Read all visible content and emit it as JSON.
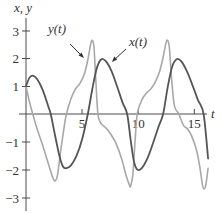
{
  "chart_data": {
    "type": "line",
    "title": "",
    "xlabel": "t",
    "ylabel": "x, y",
    "xlim": [
      0,
      16.3
    ],
    "ylim": [
      -3.4,
      3.6
    ],
    "grid": false,
    "legend": "inline annotations with arrows",
    "x_ticks": [
      5,
      10,
      15
    ],
    "x_tick_labels": [
      "5",
      "10",
      "15"
    ],
    "y_ticks": [
      3,
      2,
      1,
      -1,
      -2,
      -3
    ],
    "y_tick_labels": [
      "3",
      "2",
      "1",
      "−1",
      "−2",
      "−3"
    ],
    "series": [
      {
        "name": "x(t)",
        "label": "x(t)",
        "color": "#555555",
        "points": [
          [
            0,
            1.0
          ],
          [
            0.3,
            1.3
          ],
          [
            0.6,
            1.38
          ],
          [
            1.0,
            1.25
          ],
          [
            1.5,
            0.85
          ],
          [
            2.0,
            0.25
          ],
          [
            2.2,
            0.0
          ],
          [
            2.6,
            -0.8
          ],
          [
            3.0,
            -1.55
          ],
          [
            3.3,
            -1.9
          ],
          [
            3.6,
            -1.95
          ],
          [
            4.0,
            -1.85
          ],
          [
            4.5,
            -1.5
          ],
          [
            5.0,
            -0.9
          ],
          [
            5.5,
            0.0
          ],
          [
            5.9,
            0.9
          ],
          [
            6.3,
            1.65
          ],
          [
            6.7,
            1.97
          ],
          [
            7.1,
            1.9
          ],
          [
            7.6,
            1.55
          ],
          [
            8.1,
            1.0
          ],
          [
            8.6,
            0.4
          ],
          [
            9.0,
            0.0
          ],
          [
            9.3,
            -0.9
          ],
          [
            9.6,
            -1.7
          ],
          [
            9.9,
            -2.0
          ],
          [
            10.3,
            -1.95
          ],
          [
            10.8,
            -1.6
          ],
          [
            11.3,
            -1.05
          ],
          [
            11.8,
            -0.45
          ],
          [
            12.2,
            0.0
          ],
          [
            12.6,
            0.95
          ],
          [
            13.0,
            1.7
          ],
          [
            13.4,
            1.97
          ],
          [
            13.8,
            1.9
          ],
          [
            14.3,
            1.55
          ],
          [
            14.8,
            1.05
          ],
          [
            15.3,
            0.5
          ],
          [
            15.8,
            0.0
          ],
          [
            16.2,
            -1.6
          ]
        ]
      },
      {
        "name": "y(t)",
        "label": "y(t)",
        "color": "#a8a8a8",
        "points": [
          [
            0,
            1.0
          ],
          [
            0.3,
            0.45
          ],
          [
            0.6,
            0.0
          ],
          [
            1.0,
            -0.55
          ],
          [
            1.5,
            -1.15
          ],
          [
            2.0,
            -1.8
          ],
          [
            2.4,
            -2.3
          ],
          [
            2.6,
            -2.4
          ],
          [
            2.8,
            -2.2
          ],
          [
            3.1,
            -1.3
          ],
          [
            3.4,
            -0.45
          ],
          [
            3.6,
            0.0
          ],
          [
            4.0,
            0.55
          ],
          [
            4.4,
            0.9
          ],
          [
            4.8,
            1.1
          ],
          [
            5.2,
            1.45
          ],
          [
            5.5,
            1.95
          ],
          [
            5.75,
            2.5
          ],
          [
            5.9,
            2.65
          ],
          [
            6.05,
            2.4
          ],
          [
            6.2,
            1.3
          ],
          [
            6.4,
            0.0
          ],
          [
            6.7,
            -0.35
          ],
          [
            7.1,
            -0.5
          ],
          [
            7.5,
            -0.7
          ],
          [
            8.0,
            -1.05
          ],
          [
            8.5,
            -1.6
          ],
          [
            8.9,
            -2.2
          ],
          [
            9.2,
            -2.55
          ],
          [
            9.3,
            -2.6
          ],
          [
            9.5,
            -2.2
          ],
          [
            9.7,
            -1.0
          ],
          [
            9.9,
            0.0
          ],
          [
            10.3,
            0.5
          ],
          [
            10.7,
            0.75
          ],
          [
            11.1,
            0.9
          ],
          [
            11.5,
            1.15
          ],
          [
            11.9,
            1.55
          ],
          [
            12.2,
            2.05
          ],
          [
            12.45,
            2.55
          ],
          [
            12.6,
            2.65
          ],
          [
            12.75,
            2.4
          ],
          [
            12.95,
            1.3
          ],
          [
            13.2,
            0.3
          ],
          [
            13.6,
            0.0
          ],
          [
            14.0,
            -0.4
          ],
          [
            14.4,
            -0.55
          ],
          [
            14.8,
            -0.85
          ],
          [
            15.2,
            -1.35
          ],
          [
            15.5,
            -2.0
          ],
          [
            15.7,
            -2.55
          ],
          [
            15.85,
            -2.7
          ],
          [
            16.0,
            -2.55
          ],
          [
            16.2,
            -1.95
          ]
        ]
      }
    ],
    "annotations": [
      {
        "text": "y(t)",
        "arrow_to_t": 5.2,
        "arrow_to_value": 2.0
      },
      {
        "text": "x(t)",
        "arrow_to_t": 7.7,
        "arrow_to_value": 1.9
      }
    ]
  },
  "labels": {
    "y_axis": "x, y",
    "x_axis": "t",
    "y_series": "y(t)",
    "x_series": "x(t)",
    "ticks_x": [
      "5",
      "10",
      "15"
    ],
    "ticks_y": [
      "3",
      "2",
      "1",
      "−1",
      "−2",
      "−3"
    ]
  }
}
